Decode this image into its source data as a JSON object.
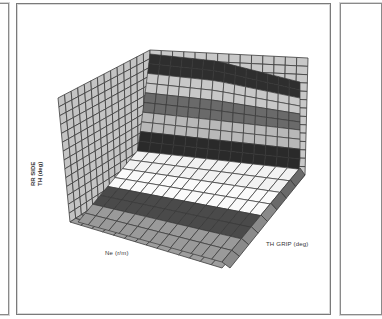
{
  "chart_data": {
    "type": "surface3d",
    "title": "",
    "xlabel": "Ne (r/m)",
    "ylabel": "TH GRIP (deg)",
    "zlabel": "RR SIDE TH (deg)",
    "zlabel_lines": [
      "RR SIDE",
      "TH (deg)"
    ],
    "grid": true,
    "tick_labels_visible": false,
    "colormap": "grayscale bands",
    "surface_description": "Surface rises from a flat floor along TH GRIP axis and climbs steeply up toward the back wall; horizontal grayscale contour bands indicate RR SIDE TH levels",
    "bands_top_to_bottom": [
      {
        "level": 9,
        "shade": "#2e2e2e"
      },
      {
        "level": 8,
        "shade": "#c8c8c8"
      },
      {
        "level": 7,
        "shade": "#6a6a6a"
      },
      {
        "level": 6,
        "shade": "#b8b8b8"
      },
      {
        "level": 5,
        "shade": "#2a2a2a"
      },
      {
        "level": 4,
        "shade": "#f2f2f2"
      },
      {
        "level": 3,
        "shade": "#fafafa"
      },
      {
        "level": 2,
        "shade": "#4a4a4a"
      },
      {
        "level": 1,
        "shade": "#9a9a9a"
      }
    ],
    "grid_divisions": {
      "x": 14,
      "y": 14,
      "z": 14
    }
  },
  "labels": {
    "x_axis": "Ne (r/m)",
    "y_axis": "TH GRIP (deg)",
    "z_axis_line1": "RR SIDE",
    "z_axis_line2": "TH (deg)"
  }
}
